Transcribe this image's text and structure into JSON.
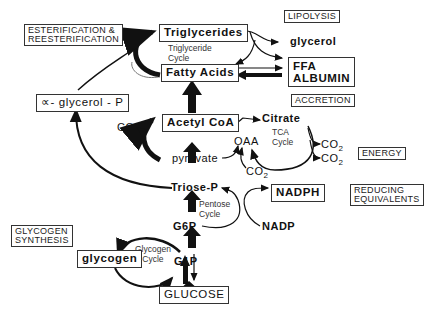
{
  "labels": {
    "esterification": [
      "ESTERIFICATION &",
      "REESTERIFICATION"
    ],
    "lipolysis": "LIPOLYSIS",
    "accretion": "ACCRETION",
    "energy": "ENERGY",
    "reducing": [
      "REDUCING",
      "EQUIVALENTS"
    ],
    "glycogen_synthesis": [
      "GLYCOGEN",
      "SYNTHESIS"
    ]
  },
  "nodes": {
    "triglycerides": "Triglycerides",
    "fatty_acids": "Fatty Acids",
    "glycerol": "glycerol",
    "ffa_albumin": [
      "FFA",
      "ALBUMIN"
    ],
    "alpha_glycerol_p": "∝- glycerol - P",
    "acetyl_coa": "Acetyl CoA",
    "citrate": "Citrate",
    "oaa": "OAA",
    "pyruvate": "pyruvate",
    "triose_p": "Triose-P",
    "nadph": "NADPH",
    "nadp": "NADP",
    "g6p": "G6P",
    "g1p": "G1P",
    "glycogen": "glycogen",
    "glucose": "GLUCOSE"
  },
  "co2": "CO",
  "co2_sub": "2",
  "cycles": {
    "triglyceride": [
      "Triglyceride",
      "Cycle"
    ],
    "tca": [
      "TCA",
      "Cycle"
    ],
    "pentose": [
      "Pentose",
      "Cycle"
    ],
    "glycogen": [
      "Glycogen",
      "Cycle"
    ]
  }
}
